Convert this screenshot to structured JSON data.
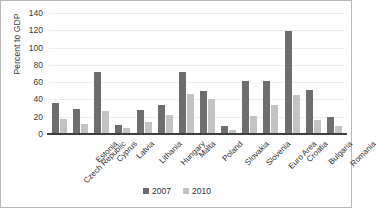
{
  "chart_data": {
    "type": "bar",
    "title": "",
    "xlabel": "",
    "ylabel": "Percent to GDP",
    "ylim": [
      0,
      140
    ],
    "ytick_step": 20,
    "yticks": [
      "140",
      "120",
      "100",
      "80",
      "60",
      "40",
      "20",
      "0"
    ],
    "grid": true,
    "legend_position": "bottom",
    "categories": [
      "Czech Republic",
      "Estonia",
      "Cyprus",
      "Latvia",
      "Lithania",
      "Hungary",
      "Malta",
      "Poland",
      "Slovakia",
      "Slovenia",
      "Euro Area",
      "Croatia",
      "Bulgaria",
      "Romania"
    ],
    "series": [
      {
        "name": "2007",
        "color": "#6e6e6e",
        "values": [
          36,
          29,
          72,
          11,
          28,
          34,
          72,
          50,
          9,
          61,
          61,
          119,
          51,
          20
        ]
      },
      {
        "name": "2010",
        "color": "#c3c3c3",
        "values": [
          17,
          12,
          27,
          7,
          14,
          22,
          46,
          41,
          5,
          21,
          34,
          45,
          16,
          9
        ]
      }
    ]
  },
  "legend": {
    "items": [
      {
        "label": "2007",
        "color": "#6e6e6e"
      },
      {
        "label": "2010",
        "color": "#c3c3c3"
      }
    ]
  }
}
